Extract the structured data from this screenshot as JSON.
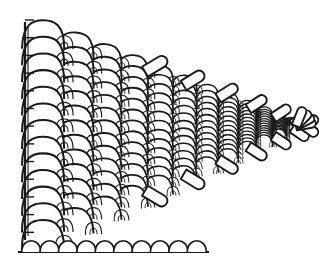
{
  "figure": {
    "title": "Perspective line drawing of a scale-stitch fabric swatch",
    "kind": "line-art-diagram",
    "background_color": "#ffffff",
    "line_color": "#1a1a1a",
    "fill_color": "#ffffff",
    "canvas": {
      "width": 328,
      "height": 263
    }
  },
  "chart_data": {
    "type": "diagram",
    "xlabel": "",
    "ylabel": "",
    "grid": false,
    "legend": "none"
  },
  "geometry": {
    "left_edge": {
      "x": 25,
      "y_top": 22,
      "y_bottom": 240,
      "stroke_width": 2.2,
      "inner_offset": 3
    },
    "base_line": {
      "x_start": 18,
      "x_end": 209,
      "y": 252,
      "stroke_width": 2.2
    },
    "vanishing_point": {
      "x": 309,
      "y": 126
    },
    "field": {
      "top_left": {
        "x": 27,
        "y": 20
      },
      "bottom_left": {
        "x": 27,
        "y": 250
      },
      "apex": {
        "x": 300,
        "y": 126
      },
      "rows": 13,
      "columns": 13,
      "near_scale_width": 44,
      "near_scale_height": 30,
      "far_scale_width": 13,
      "far_scale_height": 10
    },
    "base_row": {
      "count": 10,
      "x_start": 22,
      "x_end": 206,
      "y": 252,
      "arch_width": 19,
      "arch_height": 13
    },
    "fingers": {
      "count_upper": 7,
      "count_lower": 7,
      "length_near": 30,
      "length_far": 14,
      "width_near": 13,
      "width_far": 8
    },
    "strokes": {
      "outer_scale": 2.1,
      "inner_scale": 1.5,
      "small_scale": 1.2,
      "finger": 1.9
    }
  }
}
